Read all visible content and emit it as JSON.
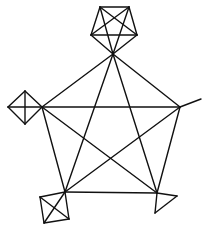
{
  "diagram": {
    "type": "graph",
    "stroke_color": "#111111",
    "background": "#ffffff",
    "nodes": {
      "hub_top": [
        113,
        54
      ],
      "hub_left": [
        42,
        107
      ],
      "hub_right": [
        180,
        107
      ],
      "hub_bl": [
        65,
        192
      ],
      "hub_br": [
        157,
        193
      ],
      "top_k5_a": [
        100,
        7
      ],
      "top_k5_b": [
        129,
        7
      ],
      "top_k5_c": [
        137,
        35
      ],
      "top_k5_d": [
        91,
        35
      ],
      "left_top": [
        25,
        91
      ],
      "left_left": [
        8,
        107
      ],
      "left_bottom": [
        25,
        124
      ],
      "right_pendant": [
        201,
        99
      ],
      "bl_tl": [
        40,
        197
      ],
      "bl_br": [
        69,
        219
      ],
      "bl_bl": [
        44,
        223
      ],
      "br_right": [
        177,
        196
      ],
      "br_bottom": [
        155,
        213
      ]
    },
    "edges": [
      [
        "hub_top",
        "hub_left"
      ],
      [
        "hub_top",
        "hub_right"
      ],
      [
        "hub_top",
        "hub_bl"
      ],
      [
        "hub_top",
        "hub_br"
      ],
      [
        "hub_left",
        "hub_right"
      ],
      [
        "hub_left",
        "hub_bl"
      ],
      [
        "hub_left",
        "hub_br"
      ],
      [
        "hub_right",
        "hub_bl"
      ],
      [
        "hub_right",
        "hub_br"
      ],
      [
        "hub_bl",
        "hub_br"
      ],
      [
        "top_k5_a",
        "top_k5_b"
      ],
      [
        "top_k5_a",
        "top_k5_c"
      ],
      [
        "top_k5_a",
        "top_k5_d"
      ],
      [
        "top_k5_a",
        "hub_top"
      ],
      [
        "top_k5_b",
        "top_k5_c"
      ],
      [
        "top_k5_b",
        "top_k5_d"
      ],
      [
        "top_k5_b",
        "hub_top"
      ],
      [
        "top_k5_c",
        "top_k5_d"
      ],
      [
        "top_k5_c",
        "hub_top"
      ],
      [
        "top_k5_d",
        "hub_top"
      ],
      [
        "left_top",
        "left_left"
      ],
      [
        "left_top",
        "left_bottom"
      ],
      [
        "left_top",
        "hub_left"
      ],
      [
        "left_left",
        "left_bottom"
      ],
      [
        "left_left",
        "hub_left"
      ],
      [
        "left_bottom",
        "hub_left"
      ],
      [
        "hub_right",
        "right_pendant"
      ],
      [
        "hub_bl",
        "bl_tl"
      ],
      [
        "hub_bl",
        "bl_br"
      ],
      [
        "hub_bl",
        "bl_bl"
      ],
      [
        "bl_tl",
        "bl_br"
      ],
      [
        "bl_tl",
        "bl_bl"
      ],
      [
        "bl_br",
        "bl_bl"
      ],
      [
        "hub_br",
        "br_right"
      ],
      [
        "hub_br",
        "br_bottom"
      ],
      [
        "br_right",
        "br_bottom"
      ]
    ]
  }
}
